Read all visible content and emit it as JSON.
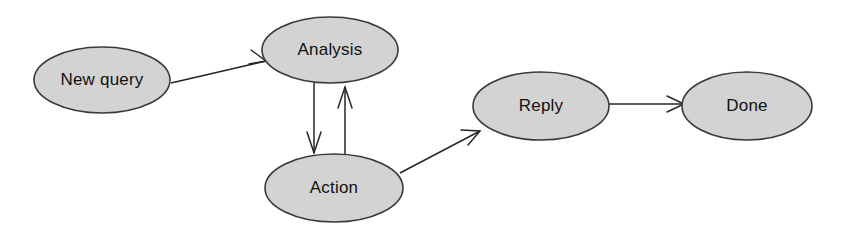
{
  "diagram": {
    "background_color": "#ffffff",
    "node_fill_color": "#d3d3d3",
    "node_stroke_color": "#3a3a3a",
    "edge_color": "#262626",
    "nodes": [
      {
        "id": "new_query",
        "label": "New query",
        "cx": 102,
        "cy": 80,
        "rx": 68,
        "ry": 33
      },
      {
        "id": "analysis",
        "label": "Analysis",
        "cx": 330,
        "cy": 50,
        "rx": 68,
        "ry": 33
      },
      {
        "id": "action",
        "label": "Action",
        "cx": 334,
        "cy": 188,
        "rx": 69,
        "ry": 34
      },
      {
        "id": "reply",
        "label": "Reply",
        "cx": 541,
        "cy": 106,
        "rx": 68,
        "ry": 34
      },
      {
        "id": "done",
        "label": "Done",
        "cx": 747,
        "cy": 106,
        "rx": 65,
        "ry": 34
      }
    ],
    "edges": [
      {
        "id": "new_query_to_analysis",
        "from": "New query",
        "to": "Analysis",
        "direction": "one-way"
      },
      {
        "id": "analysis_to_action",
        "from": "Analysis",
        "to": "Action",
        "direction": "one-way"
      },
      {
        "id": "action_to_analysis",
        "from": "Action",
        "to": "Analysis",
        "direction": "one-way"
      },
      {
        "id": "action_to_reply",
        "from": "Action",
        "to": "Reply",
        "direction": "one-way"
      },
      {
        "id": "reply_to_done",
        "from": "Reply",
        "to": "Done",
        "direction": "one-way"
      }
    ]
  }
}
